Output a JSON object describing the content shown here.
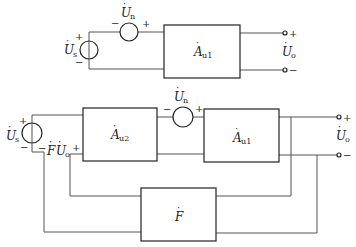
{
  "top_circuit": {
    "source_label": "U",
    "source_sub": "s",
    "noise_label": "U",
    "noise_sub": "n",
    "amp_label": "A",
    "amp_sub": "u1",
    "output_label": "U",
    "output_sub": "o",
    "plus": "+",
    "minus": "−"
  },
  "bottom_circuit": {
    "source_label": "U",
    "source_sub": "s",
    "noise_label": "U",
    "noise_sub": "n",
    "amp2_label": "A",
    "amp2_sub": "u2",
    "amp1_label": "A",
    "amp1_sub": "u1",
    "feedback_label": "F",
    "feedback_voltage_label": "F",
    "feedback_voltage_U": "U",
    "feedback_voltage_sub": "o",
    "output_label": "U",
    "output_sub": "o",
    "plus": "+",
    "minus": "−"
  }
}
